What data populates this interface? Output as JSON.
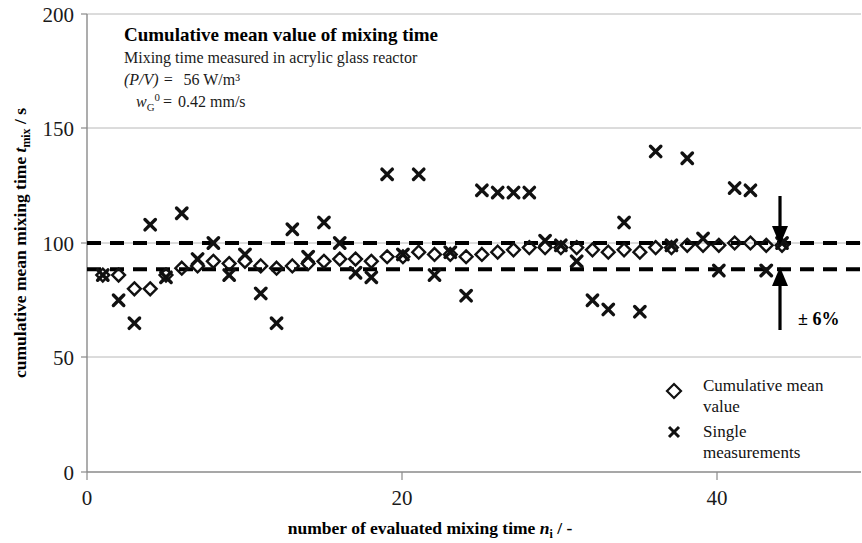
{
  "figure": {
    "title": "Cumulative mean value of mixing time",
    "subtitle": "Mixing time measured in acrylic glass reactor",
    "param1_name": "(P/V) =",
    "param1_value": "56 W/m³",
    "param2_name": "w",
    "param2_sub": "G",
    "param2_sup": "0",
    "param2_eq": "=",
    "param2_value": "0.42 mm/s",
    "band_label": "± 6%"
  },
  "axes": {
    "y_title_main": "cumulative mean mixing time ",
    "y_title_italic": "t",
    "y_title_sub": "mix",
    "y_title_unit": " / s",
    "x_title_main": "number of evaluated mixing time ",
    "x_title_italic": "n",
    "x_title_sub": "i",
    "x_title_unit": " / -",
    "y_ticks": [
      "0",
      "50",
      "100",
      "150",
      "200"
    ],
    "x_ticks": [
      "0",
      "20",
      "40"
    ]
  },
  "legend": {
    "items": [
      {
        "marker": "diamond-marker",
        "label_line1": "Cumulative mean",
        "label_line2": "value"
      },
      {
        "marker": "cross-marker",
        "label_line1": "Single",
        "label_line2": "measurements"
      }
    ]
  },
  "colors": {
    "marker": "#111111",
    "grid": "#b8b8b8",
    "axis": "#8a8a8a",
    "dashed": "#000000"
  },
  "chart_data": {
    "type": "scatter",
    "title": "Cumulative mean value of mixing time",
    "subtitle": "Mixing time measured in acrylic glass reactor",
    "xlabel": "number of evaluated mixing time n_i / -",
    "ylabel": "cumulative mean mixing time t_mix / s",
    "xlim": [
      0,
      49
    ],
    "ylim": [
      0,
      200
    ],
    "x_ticks": [
      0,
      20,
      40
    ],
    "y_ticks": [
      0,
      50,
      100,
      150,
      200
    ],
    "grid": "horizontal",
    "legend_position": "inside-bottom-right",
    "annotations": [
      {
        "text": "± 6%",
        "x": 45.5,
        "y": 63
      },
      {
        "text": "upper tolerance line",
        "type": "dashed-hline",
        "y": 100
      },
      {
        "text": "lower tolerance line",
        "type": "dashed-hline",
        "y": 88.5
      }
    ],
    "reference_lines": [
      {
        "name": "upper_band",
        "y": 100,
        "style": "dashed"
      },
      {
        "name": "lower_band",
        "y": 88.5,
        "style": "dashed"
      }
    ],
    "series": [
      {
        "name": "Single measurements",
        "marker": "x",
        "x": [
          1,
          2,
          3,
          4,
          5,
          6,
          7,
          8,
          9,
          10,
          11,
          12,
          13,
          14,
          15,
          16,
          17,
          18,
          19,
          20,
          21,
          22,
          23,
          24,
          25,
          26,
          27,
          28,
          29,
          30,
          31,
          32,
          33,
          34,
          35,
          36,
          37,
          38,
          39,
          40,
          41,
          42,
          43,
          44
        ],
        "y": [
          86,
          75,
          65,
          108,
          85,
          113,
          93,
          100,
          86,
          95,
          78,
          65,
          106,
          94,
          109,
          100,
          87,
          85,
          130,
          95,
          130,
          86,
          96,
          77,
          123,
          122,
          122,
          122,
          101,
          99,
          92,
          75,
          71,
          109,
          70,
          140,
          99,
          137,
          102,
          88,
          124,
          123,
          88,
          100
        ]
      },
      {
        "name": "Cumulative mean value",
        "marker": "diamond",
        "x": [
          1,
          2,
          3,
          4,
          5,
          6,
          7,
          8,
          9,
          10,
          11,
          12,
          13,
          14,
          15,
          16,
          17,
          18,
          19,
          20,
          21,
          22,
          23,
          24,
          25,
          26,
          27,
          28,
          29,
          30,
          31,
          32,
          33,
          34,
          35,
          36,
          37,
          38,
          39,
          40,
          41,
          42,
          43,
          44
        ],
        "y": [
          86,
          86,
          80,
          80,
          86,
          89,
          90,
          92,
          91,
          92,
          90,
          89,
          90,
          91,
          92,
          93,
          93,
          92,
          94,
          94,
          96,
          95,
          95,
          94,
          95,
          96,
          97,
          98,
          98,
          98,
          98,
          97,
          96,
          97,
          96,
          98,
          98,
          99,
          99,
          99,
          100,
          100,
          99,
          99
        ]
      }
    ]
  }
}
